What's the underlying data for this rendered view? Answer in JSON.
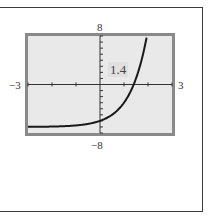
{
  "chart_data": {
    "type": "line",
    "title": "",
    "function": "y = 4^x - 7",
    "xlim": [
      -3,
      3
    ],
    "ylim": [
      -8,
      8
    ],
    "xlabel": "",
    "ylabel": "",
    "tick_labels": {
      "xmin": "−3",
      "xmax": "3",
      "ymin": "−8",
      "ymax": "8"
    },
    "x_scale_ticks": 1,
    "y_scale_ticks": 1,
    "grid": false,
    "annotations": [
      {
        "text": "1.4",
        "meaning": "x-intercept"
      }
    ],
    "series": [
      {
        "name": "curve",
        "x": [
          -3,
          -2,
          -1,
          0,
          0.5,
          1,
          1.2,
          1.4,
          1.6,
          1.8,
          1.95
        ],
        "y": [
          -6.98,
          -6.94,
          -6.75,
          -6,
          -5,
          -3,
          -1.72,
          0.0,
          2.19,
          5.13,
          7.93
        ]
      }
    ],
    "colors": {
      "frame": "#8a8a8a",
      "screen": "#e9e9e9",
      "curve": "#1a1a1a"
    }
  }
}
